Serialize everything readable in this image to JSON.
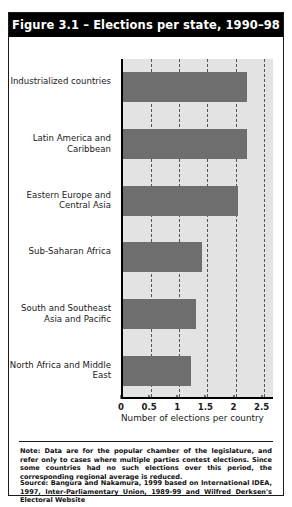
{
  "figure": {
    "title": "Figure 3.1 – Elections per state, 1990–98",
    "note": "Note: Data are for the popular chamber of the legislature, and refer only to cases where multiple parties contest elections. Since some countries had no such elections over this period, the corresponding regional average is reduced.",
    "source": "Source: Bangura and Nakamura, 1999 based on International IDEA, 1997, Inter-Parliamentary Union, 1989-99 and Wilfred Derksen's Electoral Website"
  },
  "chart_data": {
    "type": "bar",
    "orientation": "horizontal",
    "title": "Figure 3.1 – Elections per state, 1990–98",
    "xlabel": "Number of elections per country",
    "ylabel": "",
    "categories": [
      "Industrialized countries",
      "Latin America and Caribbean",
      "Eastern Europe and Central Asia",
      "Sub-Saharan Africa",
      "South and Southeast Asia and Pacific",
      "North Africa and Middle East"
    ],
    "values": [
      2.2,
      2.2,
      2.05,
      1.4,
      1.3,
      1.2
    ],
    "xlim": [
      0,
      2.7
    ],
    "xticks": [
      0,
      0.5,
      1,
      1.5,
      2,
      2.5
    ],
    "xticklabels": [
      "0",
      "0.5",
      "1",
      "1.5",
      "2",
      "2.5"
    ],
    "grid": "vertical-dashed",
    "legend": "none",
    "bar_color": "#6e6e6e",
    "plot_background": "#e3e3e3"
  }
}
